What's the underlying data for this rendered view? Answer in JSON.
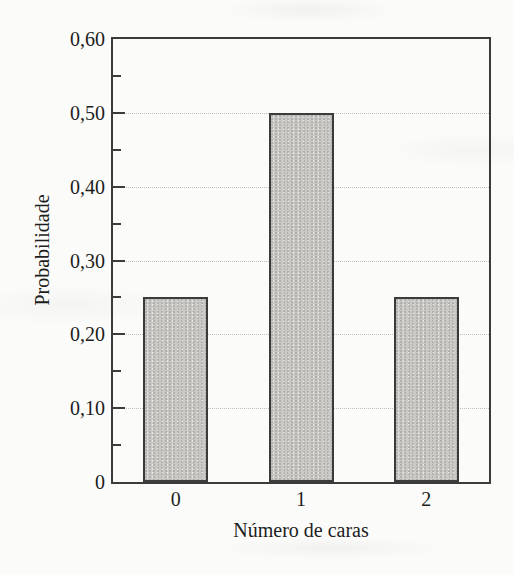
{
  "colors": {
    "bar_fill": "#cac9c6",
    "bar_border": "#3b3b3b",
    "frame": "#3b3b3b",
    "gridline": "#c0c0c0",
    "text": "#1d1d1d",
    "background": "#fbfbf9"
  },
  "chart_data": {
    "type": "bar",
    "categories": [
      "0",
      "1",
      "2"
    ],
    "values": [
      0.25,
      0.5,
      0.25
    ],
    "title": "",
    "xlabel": "Número de caras",
    "ylabel": "Probabilidade",
    "ylim": [
      0,
      0.6
    ],
    "yticks_major": [
      0,
      0.1,
      0.2,
      0.3,
      0.4,
      0.5,
      0.6
    ],
    "ytick_labels": [
      "0",
      "0,10",
      "0,20",
      "0,30",
      "0,40",
      "0,50",
      "0,60"
    ],
    "yticks_minor": [
      0.05,
      0.15,
      0.25,
      0.35,
      0.45,
      0.55
    ],
    "grid": "horizontal dotted lines at major ticks",
    "legend": "none"
  }
}
